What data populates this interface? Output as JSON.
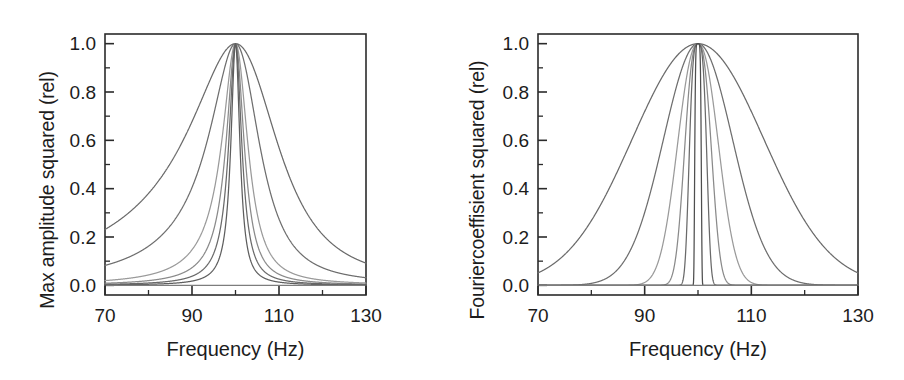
{
  "figure": {
    "width": 904,
    "height": 380,
    "background": "#ffffff",
    "line_color": "#555555",
    "axis_color": "#2b2b2b",
    "panel_count": 2
  },
  "chart_data": [
    {
      "type": "line",
      "panel": "left",
      "title": "",
      "xlabel": "Frequency (Hz)",
      "ylabel": "Max amplitude squared (rel)",
      "xlim": [
        70,
        130
      ],
      "ylim": [
        -0.04,
        1.04
      ],
      "xticks": [
        70,
        90,
        110,
        130
      ],
      "xticklabels": [
        "70",
        "90",
        "110",
        "130"
      ],
      "xminorticks": [
        80,
        100,
        120
      ],
      "yticks": [
        0.0,
        0.2,
        0.4,
        0.6,
        0.8,
        1.0
      ],
      "yticklabels": [
        "0.0",
        "0.2",
        "0.4",
        "0.6",
        "0.8",
        "1.0"
      ],
      "yminorticks": [
        0.1,
        0.3,
        0.5,
        0.7,
        0.9
      ],
      "grid": false,
      "legend": "none",
      "peak_frequency_hz": 100,
      "peak_value": 1.0,
      "curve_shape": "asymmetric lorentzian resonance, skewed toward lower frequency",
      "series": [
        {
          "name": "Q1 broadest",
          "halfwidth_hz": 13.0,
          "skew": 0.34,
          "color": "#6a6a6a",
          "value_at_70hz": 0.2,
          "value_at_130hz": 0.14
        },
        {
          "name": "Q2",
          "halfwidth_hz": 7.2,
          "skew": 0.26,
          "color": "#6e6e6e",
          "value_at_70hz": 0.03,
          "value_at_130hz": 0.02
        },
        {
          "name": "Q3",
          "halfwidth_hz": 3.6,
          "skew": 0.18,
          "color": "#9a9a9a",
          "value_at_70hz": 0.01,
          "value_at_130hz": 0.01
        },
        {
          "name": "Q4",
          "halfwidth_hz": 2.5,
          "skew": 0.13,
          "color": "#8a8a8a",
          "value_at_70hz": 0.0,
          "value_at_130hz": 0.0
        },
        {
          "name": "Q5",
          "halfwidth_hz": 1.8,
          "skew": 0.1,
          "color": "#6a6a6a",
          "value_at_70hz": 0.0,
          "value_at_130hz": 0.0
        },
        {
          "name": "Q6 narrowest",
          "halfwidth_hz": 1.25,
          "skew": 0.07,
          "color": "#5e5e5e",
          "value_at_70hz": 0.0,
          "value_at_130hz": 0.0
        }
      ]
    },
    {
      "type": "line",
      "panel": "right",
      "title": "",
      "xlabel": "Frequency (Hz)",
      "ylabel": "Fouriercoeffisient squared (rel)",
      "xlim": [
        70,
        130
      ],
      "ylim": [
        -0.04,
        1.04
      ],
      "xticks": [
        70,
        90,
        110,
        130
      ],
      "xticklabels": [
        "70",
        "90",
        "110",
        "130"
      ],
      "xminorticks": [
        80,
        100,
        120
      ],
      "yticks": [
        0.0,
        0.2,
        0.4,
        0.6,
        0.8,
        1.0
      ],
      "yticklabels": [
        "0.0",
        "0.2",
        "0.4",
        "0.6",
        "0.8",
        "1.0"
      ],
      "yminorticks": [
        0.1,
        0.3,
        0.5,
        0.7,
        0.9
      ],
      "grid": false,
      "legend": "none",
      "peak_frequency_hz": 100,
      "peak_value": 1.0,
      "curve_shape": "symmetric gaussian-like spectral peak",
      "series": [
        {
          "name": "W1 broadest",
          "sigma_hz": 14.5,
          "power": 2.0,
          "color": "#6a6a6a",
          "value_at_70hz": 0.07,
          "value_at_130hz": 0.07
        },
        {
          "name": "W2",
          "sigma_hz": 7.6,
          "power": 2.0,
          "color": "#6e6e6e",
          "value_at_70hz": 0.0,
          "value_at_130hz": 0.0
        },
        {
          "name": "W3",
          "sigma_hz": 4.3,
          "power": 2.2,
          "color": "#9a9a9a",
          "value_at_70hz": 0.0,
          "value_at_130hz": 0.0
        },
        {
          "name": "W4",
          "sigma_hz": 2.7,
          "power": 2.6,
          "color": "#8a8a8a",
          "value_at_70hz": 0.0,
          "value_at_130hz": 0.0
        },
        {
          "name": "W5",
          "sigma_hz": 1.7,
          "power": 3.4,
          "color": "#6a6a6a",
          "value_at_70hz": 0.0,
          "value_at_130hz": 0.0
        },
        {
          "name": "W6 spike",
          "sigma_hz": 0.62,
          "power": 6.0,
          "color": "#4e4e4e",
          "value_at_70hz": 0.0,
          "value_at_130hz": 0.0
        }
      ]
    }
  ],
  "panels": {
    "left": {
      "name": "max-amplitude-panel",
      "ylabel": "Max amplitude squared (rel)",
      "xlabel": "Frequency (Hz)",
      "xticklabels": [
        "70",
        "90",
        "110",
        "130"
      ],
      "yticklabels": [
        "0.0",
        "0.2",
        "0.4",
        "0.6",
        "0.8",
        "1.0"
      ]
    },
    "right": {
      "name": "fourier-coefficient-panel",
      "ylabel": "Fouriercoeffisient squared (rel)",
      "xlabel": "Frequency (Hz)",
      "xticklabels": [
        "70",
        "90",
        "110",
        "130"
      ],
      "yticklabels": [
        "0.0",
        "0.2",
        "0.4",
        "0.6",
        "0.8",
        "1.0"
      ]
    }
  }
}
